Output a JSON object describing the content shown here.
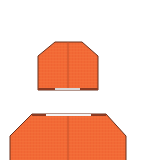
{
  "image": {
    "width": 143,
    "height": 160,
    "background": "#ffffff"
  },
  "colors": {
    "fill": "#F26A35",
    "outline": "#6B2E1A",
    "seam": "#C4502A",
    "edge_dark": "#8A3A22",
    "edge_light": "#D8D8D8",
    "edge_white": "#F4F4F4"
  },
  "shapes": [
    {
      "name": "upper-block",
      "description": "Orange chamfered block with vertical center seam"
    },
    {
      "name": "lower-block",
      "description": "Larger orange chamfered block with vertical center seam, cropped at bottom"
    }
  ]
}
